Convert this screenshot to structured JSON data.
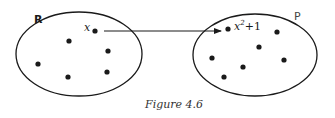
{
  "diagram": {
    "domain_set": {
      "label": "R",
      "ellipse": {
        "cx": 79,
        "cy": 54,
        "rx": 63,
        "ry": 42
      },
      "points": [
        [
          95,
          31
        ],
        [
          69,
          41
        ],
        [
          108,
          51
        ],
        [
          38,
          64
        ],
        [
          68,
          77
        ],
        [
          107,
          72
        ]
      ],
      "element_label": "x"
    },
    "codomain_set": {
      "label": "P",
      "ellipse": {
        "cx": 255,
        "cy": 55,
        "rx": 62,
        "ry": 41
      },
      "points": [
        [
          228,
          29
        ],
        [
          277,
          32
        ],
        [
          259,
          47
        ],
        [
          212,
          58
        ],
        [
          243,
          67
        ],
        [
          284,
          60
        ],
        [
          224,
          77
        ]
      ],
      "element_label_base": "x",
      "element_label_exp": "2",
      "element_label_rest": "+1"
    },
    "arrow": {
      "from": [
        104,
        31
      ],
      "to": [
        221,
        31
      ]
    },
    "caption": "Figure 4.6",
    "colors": {
      "stroke": "#1a1a1a",
      "background": "#ffffff"
    }
  }
}
